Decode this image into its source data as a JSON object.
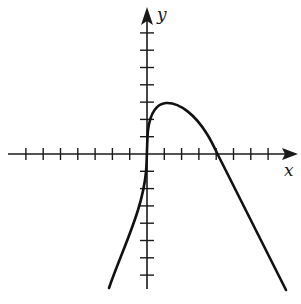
{
  "figure": {
    "type": "function-graph",
    "axes": {
      "x_label": "x",
      "y_label": "y",
      "origin_px": [
        147,
        154
      ],
      "unit_px": 17.3,
      "x_ticks": [
        -7,
        -6,
        -5,
        -4,
        -3,
        -2,
        -1,
        1,
        2,
        3,
        4,
        5,
        6,
        7
      ],
      "y_ticks": [
        -7,
        -6,
        -5,
        -4,
        -3,
        -2,
        -1,
        1,
        2,
        3,
        4,
        5,
        6,
        7
      ],
      "tick_labels_shown": false
    },
    "curve": {
      "description": "Curve with a vertical tangent at the y-axis, rising to a local maximum near (1, 3), then decreasing and crossing the x-axis near x = 4",
      "approx_points": [
        [
          -2.2,
          -7.7
        ],
        [
          -1.1,
          -4.4
        ],
        [
          -0.4,
          -2.6
        ],
        [
          0,
          -1.2
        ],
        [
          0.1,
          0.8
        ],
        [
          0.2,
          2.0
        ],
        [
          0.5,
          2.7
        ],
        [
          1,
          3.0
        ],
        [
          1.9,
          2.7
        ],
        [
          3.1,
          1.7
        ],
        [
          4,
          0
        ],
        [
          6,
          -3.2
        ],
        [
          8,
          -7.8
        ]
      ],
      "local_max": [
        1,
        3
      ],
      "x_intercept": 4,
      "color": "#111111"
    }
  }
}
